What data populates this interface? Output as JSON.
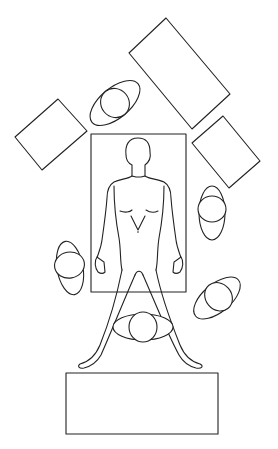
{
  "diagram": {
    "type": "operating-room-layout",
    "elements": [
      {
        "kind": "operating-table",
        "label": ""
      },
      {
        "kind": "patient-figure",
        "label": ""
      },
      {
        "kind": "instrument-table",
        "position": "top-right",
        "label": ""
      },
      {
        "kind": "instrument-table",
        "position": "left",
        "label": ""
      },
      {
        "kind": "instrument-table",
        "position": "right",
        "label": ""
      },
      {
        "kind": "instrument-table",
        "position": "bottom",
        "label": ""
      },
      {
        "kind": "staff-member",
        "position": "top-left",
        "label": ""
      },
      {
        "kind": "staff-member",
        "position": "right-upper",
        "label": ""
      },
      {
        "kind": "staff-member",
        "position": "left",
        "label": ""
      },
      {
        "kind": "staff-member",
        "position": "right-lower",
        "label": ""
      },
      {
        "kind": "staff-member",
        "position": "bottom-center",
        "label": ""
      }
    ],
    "colors": {
      "line": "#222222",
      "background": "#ffffff"
    }
  }
}
